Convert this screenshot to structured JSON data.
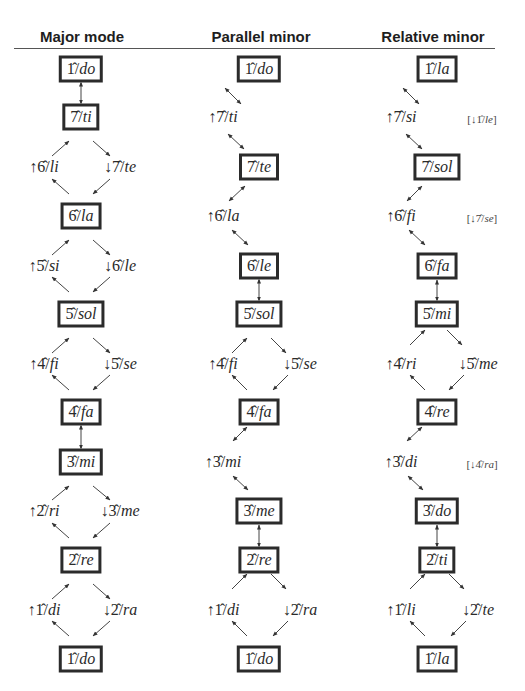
{
  "headers": {
    "major": "Major mode",
    "parallel": "Parallel minor",
    "relative": "Relative minor"
  },
  "columns": {
    "major": {
      "x": 81,
      "nodes": [
        {
          "id": "m1",
          "deg": "1̂",
          "syl": "do",
          "boxed": true,
          "x": 81,
          "y": 69
        },
        {
          "id": "m2",
          "deg": "7̂",
          "syl": "ti",
          "boxed": true,
          "x": 81,
          "y": 117
        },
        {
          "id": "m3",
          "deg": "↑6̂",
          "syl": "li",
          "boxed": false,
          "x": 44,
          "y": 167
        },
        {
          "id": "m4",
          "deg": "↓7̂",
          "syl": "te",
          "boxed": false,
          "x": 120,
          "y": 167
        },
        {
          "id": "m5",
          "deg": "6̂",
          "syl": "la",
          "boxed": true,
          "x": 81,
          "y": 216
        },
        {
          "id": "m6",
          "deg": "↑5̂",
          "syl": "si",
          "boxed": false,
          "x": 44,
          "y": 266
        },
        {
          "id": "m7",
          "deg": "↓6̂",
          "syl": "le",
          "boxed": false,
          "x": 120,
          "y": 266
        },
        {
          "id": "m8",
          "deg": "5̂",
          "syl": "sol",
          "boxed": true,
          "x": 81,
          "y": 314
        },
        {
          "id": "m9",
          "deg": "↑4̂",
          "syl": "fi",
          "boxed": false,
          "x": 44,
          "y": 364
        },
        {
          "id": "m10",
          "deg": "↓5̂",
          "syl": "se",
          "boxed": false,
          "x": 120,
          "y": 364
        },
        {
          "id": "m11",
          "deg": "4̂",
          "syl": "fa",
          "boxed": true,
          "x": 81,
          "y": 412
        },
        {
          "id": "m12",
          "deg": "3̂",
          "syl": "mi",
          "boxed": true,
          "x": 81,
          "y": 462
        },
        {
          "id": "m13",
          "deg": "↑2̂",
          "syl": "ri",
          "boxed": false,
          "x": 44,
          "y": 511
        },
        {
          "id": "m14",
          "deg": "↓3̂",
          "syl": "me",
          "boxed": false,
          "x": 120,
          "y": 511
        },
        {
          "id": "m15",
          "deg": "2̂",
          "syl": "re",
          "boxed": true,
          "x": 81,
          "y": 560
        },
        {
          "id": "m16",
          "deg": "↑1̂",
          "syl": "di",
          "boxed": false,
          "x": 44,
          "y": 610
        },
        {
          "id": "m17",
          "deg": "↓2̂",
          "syl": "ra",
          "boxed": false,
          "x": 120,
          "y": 610
        },
        {
          "id": "m18",
          "deg": "1̂",
          "syl": "do",
          "boxed": true,
          "x": 81,
          "y": 659
        }
      ]
    },
    "parallel": {
      "x": 259,
      "nodes": [
        {
          "id": "p1",
          "deg": "1̂",
          "syl": "do",
          "boxed": true,
          "x": 259,
          "y": 69
        },
        {
          "id": "p2",
          "deg": "↑7̂",
          "syl": "ti",
          "boxed": false,
          "x": 223,
          "y": 117
        },
        {
          "id": "p3",
          "deg": "7̂",
          "syl": "te",
          "boxed": true,
          "x": 259,
          "y": 167
        },
        {
          "id": "p4",
          "deg": "↑6̂",
          "syl": "la",
          "boxed": false,
          "x": 223,
          "y": 216
        },
        {
          "id": "p5",
          "deg": "6̂",
          "syl": "le",
          "boxed": true,
          "x": 259,
          "y": 266
        },
        {
          "id": "p6",
          "deg": "5̂",
          "syl": "sol",
          "boxed": true,
          "x": 259,
          "y": 314
        },
        {
          "id": "p7",
          "deg": "↑4̂",
          "syl": "fi",
          "boxed": false,
          "x": 223,
          "y": 364
        },
        {
          "id": "p8",
          "deg": "↓5̂",
          "syl": "se",
          "boxed": false,
          "x": 300,
          "y": 364
        },
        {
          "id": "p9",
          "deg": "4̂",
          "syl": "fa",
          "boxed": true,
          "x": 259,
          "y": 412
        },
        {
          "id": "p10",
          "deg": "↑3̂",
          "syl": "mi",
          "boxed": false,
          "x": 223,
          "y": 462
        },
        {
          "id": "p11",
          "deg": "3̂",
          "syl": "me",
          "boxed": true,
          "x": 259,
          "y": 511
        },
        {
          "id": "p12",
          "deg": "2̂",
          "syl": "re",
          "boxed": true,
          "x": 259,
          "y": 560
        },
        {
          "id": "p13",
          "deg": "↑1̂",
          "syl": "di",
          "boxed": false,
          "x": 223,
          "y": 610
        },
        {
          "id": "p14",
          "deg": "↓2̂",
          "syl": "ra",
          "boxed": false,
          "x": 300,
          "y": 610
        },
        {
          "id": "p15",
          "deg": "1̂",
          "syl": "do",
          "boxed": true,
          "x": 259,
          "y": 659
        }
      ]
    },
    "relative": {
      "x": 437,
      "nodes": [
        {
          "id": "r1",
          "deg": "1̂",
          "syl": "la",
          "boxed": true,
          "x": 437,
          "y": 69
        },
        {
          "id": "r2",
          "deg": "↑7̂",
          "syl": "si",
          "boxed": false,
          "x": 401,
          "y": 117
        },
        {
          "id": "r3",
          "deg": "7̂",
          "syl": "sol",
          "boxed": true,
          "x": 437,
          "y": 167
        },
        {
          "id": "r4",
          "deg": "↑6̂",
          "syl": "fi",
          "boxed": false,
          "x": 401,
          "y": 216
        },
        {
          "id": "r5",
          "deg": "6̂",
          "syl": "fa",
          "boxed": true,
          "x": 437,
          "y": 266
        },
        {
          "id": "r6",
          "deg": "5̂",
          "syl": "mi",
          "boxed": true,
          "x": 437,
          "y": 314
        },
        {
          "id": "r7",
          "deg": "↑4̂",
          "syl": "ri",
          "boxed": false,
          "x": 401,
          "y": 364
        },
        {
          "id": "r8",
          "deg": "↓5̂",
          "syl": "me",
          "boxed": false,
          "x": 478,
          "y": 364
        },
        {
          "id": "r9",
          "deg": "4̂",
          "syl": "re",
          "boxed": true,
          "x": 437,
          "y": 412
        },
        {
          "id": "r10",
          "deg": "↑3̂",
          "syl": "di",
          "boxed": false,
          "x": 401,
          "y": 462
        },
        {
          "id": "r11",
          "deg": "3̂",
          "syl": "do",
          "boxed": true,
          "x": 437,
          "y": 511
        },
        {
          "id": "r12",
          "deg": "2̂",
          "syl": "ti",
          "boxed": true,
          "x": 437,
          "y": 560
        },
        {
          "id": "r13",
          "deg": "↑1̂",
          "syl": "li",
          "boxed": false,
          "x": 401,
          "y": 610
        },
        {
          "id": "r14",
          "deg": "↓2̂",
          "syl": "te",
          "boxed": false,
          "x": 478,
          "y": 610
        },
        {
          "id": "r15",
          "deg": "1̂",
          "syl": "la",
          "boxed": true,
          "x": 437,
          "y": 659
        }
      ],
      "notes": [
        {
          "id": "n1",
          "deg": "[↓1̂/",
          "syl": "le",
          "close": "]",
          "x": 482,
          "y": 119
        },
        {
          "id": "n2",
          "deg": "[↓7̂/",
          "syl": "se",
          "close": "]",
          "x": 482,
          "y": 218
        },
        {
          "id": "n3",
          "deg": "[↓4̂/",
          "syl": "ra",
          "close": "]",
          "x": 482,
          "y": 464
        }
      ]
    }
  },
  "edges": [
    {
      "x1": 81,
      "y1": 82,
      "x2": 81,
      "y2": 104,
      "both": true
    },
    {
      "x1": 69,
      "y1": 141,
      "x2": 52,
      "y2": 156,
      "both": false,
      "head": "start"
    },
    {
      "x1": 93,
      "y1": 141,
      "x2": 110,
      "y2": 156,
      "both": false,
      "head": "end"
    },
    {
      "x1": 52,
      "y1": 179,
      "x2": 69,
      "y2": 194,
      "both": false,
      "head": "start"
    },
    {
      "x1": 110,
      "y1": 179,
      "x2": 93,
      "y2": 194,
      "both": false,
      "head": "end"
    },
    {
      "x1": 69,
      "y1": 240,
      "x2": 52,
      "y2": 255,
      "both": false,
      "head": "start"
    },
    {
      "x1": 93,
      "y1": 240,
      "x2": 110,
      "y2": 255,
      "both": false,
      "head": "end"
    },
    {
      "x1": 52,
      "y1": 277,
      "x2": 69,
      "y2": 292,
      "both": false,
      "head": "start"
    },
    {
      "x1": 110,
      "y1": 277,
      "x2": 93,
      "y2": 292,
      "both": false,
      "head": "end"
    },
    {
      "x1": 69,
      "y1": 338,
      "x2": 52,
      "y2": 353,
      "both": false,
      "head": "start"
    },
    {
      "x1": 93,
      "y1": 338,
      "x2": 110,
      "y2": 353,
      "both": false,
      "head": "end"
    },
    {
      "x1": 52,
      "y1": 375,
      "x2": 69,
      "y2": 390,
      "both": false,
      "head": "start"
    },
    {
      "x1": 110,
      "y1": 375,
      "x2": 93,
      "y2": 390,
      "both": false,
      "head": "end"
    },
    {
      "x1": 81,
      "y1": 425,
      "x2": 81,
      "y2": 449,
      "both": true
    },
    {
      "x1": 69,
      "y1": 486,
      "x2": 52,
      "y2": 500,
      "both": false,
      "head": "start"
    },
    {
      "x1": 93,
      "y1": 486,
      "x2": 110,
      "y2": 500,
      "both": false,
      "head": "end"
    },
    {
      "x1": 52,
      "y1": 523,
      "x2": 69,
      "y2": 538,
      "both": false,
      "head": "start"
    },
    {
      "x1": 110,
      "y1": 523,
      "x2": 93,
      "y2": 538,
      "both": false,
      "head": "end"
    },
    {
      "x1": 69,
      "y1": 584,
      "x2": 52,
      "y2": 599,
      "both": false,
      "head": "start"
    },
    {
      "x1": 93,
      "y1": 584,
      "x2": 110,
      "y2": 599,
      "both": false,
      "head": "end"
    },
    {
      "x1": 52,
      "y1": 621,
      "x2": 69,
      "y2": 636,
      "both": false,
      "head": "start"
    },
    {
      "x1": 110,
      "y1": 621,
      "x2": 93,
      "y2": 636,
      "both": false,
      "head": "end"
    },
    {
      "x1": 241,
      "y1": 104,
      "x2": 225,
      "y2": 88,
      "both": true,
      "swap": true
    },
    {
      "x1": 228,
      "y1": 134,
      "x2": 244,
      "y2": 149,
      "both": true
    },
    {
      "x1": 245,
      "y1": 186,
      "x2": 229,
      "y2": 201,
      "both": true
    },
    {
      "x1": 232,
      "y1": 230,
      "x2": 248,
      "y2": 245,
      "both": true
    },
    {
      "x1": 259,
      "y1": 279,
      "x2": 259,
      "y2": 301,
      "both": true
    },
    {
      "x1": 247,
      "y1": 338,
      "x2": 232,
      "y2": 353,
      "both": false,
      "head": "start"
    },
    {
      "x1": 271,
      "y1": 338,
      "x2": 286,
      "y2": 353,
      "both": false,
      "head": "end"
    },
    {
      "x1": 232,
      "y1": 375,
      "x2": 247,
      "y2": 390,
      "both": false,
      "head": "start"
    },
    {
      "x1": 288,
      "y1": 375,
      "x2": 273,
      "y2": 390,
      "both": false,
      "head": "end"
    },
    {
      "x1": 247,
      "y1": 427,
      "x2": 233,
      "y2": 441,
      "both": true
    },
    {
      "x1": 233,
      "y1": 476,
      "x2": 248,
      "y2": 490,
      "both": true
    },
    {
      "x1": 259,
      "y1": 525,
      "x2": 259,
      "y2": 547,
      "both": true
    },
    {
      "x1": 247,
      "y1": 574,
      "x2": 232,
      "y2": 589,
      "both": false,
      "head": "start"
    },
    {
      "x1": 271,
      "y1": 574,
      "x2": 286,
      "y2": 589,
      "both": false,
      "head": "end"
    },
    {
      "x1": 232,
      "y1": 621,
      "x2": 247,
      "y2": 636,
      "both": false,
      "head": "start"
    },
    {
      "x1": 288,
      "y1": 621,
      "x2": 273,
      "y2": 636,
      "both": false,
      "head": "end"
    },
    {
      "x1": 419,
      "y1": 104,
      "x2": 403,
      "y2": 88,
      "both": true,
      "swap": true
    },
    {
      "x1": 406,
      "y1": 134,
      "x2": 422,
      "y2": 149,
      "both": true
    },
    {
      "x1": 422,
      "y1": 186,
      "x2": 407,
      "y2": 201,
      "both": true
    },
    {
      "x1": 409,
      "y1": 230,
      "x2": 425,
      "y2": 245,
      "both": true
    },
    {
      "x1": 437,
      "y1": 280,
      "x2": 437,
      "y2": 301,
      "both": true
    },
    {
      "x1": 425,
      "y1": 330,
      "x2": 410,
      "y2": 345,
      "both": false,
      "head": "start"
    },
    {
      "x1": 447,
      "y1": 330,
      "x2": 462,
      "y2": 345,
      "both": false,
      "head": "end"
    },
    {
      "x1": 410,
      "y1": 375,
      "x2": 425,
      "y2": 390,
      "both": false,
      "head": "start"
    },
    {
      "x1": 464,
      "y1": 375,
      "x2": 449,
      "y2": 390,
      "both": false,
      "head": "end"
    },
    {
      "x1": 422,
      "y1": 427,
      "x2": 407,
      "y2": 441,
      "both": true
    },
    {
      "x1": 408,
      "y1": 476,
      "x2": 423,
      "y2": 490,
      "both": true
    },
    {
      "x1": 437,
      "y1": 525,
      "x2": 437,
      "y2": 547,
      "both": true
    },
    {
      "x1": 425,
      "y1": 574,
      "x2": 410,
      "y2": 589,
      "both": false,
      "head": "start"
    },
    {
      "x1": 449,
      "y1": 574,
      "x2": 464,
      "y2": 589,
      "both": false,
      "head": "end"
    },
    {
      "x1": 410,
      "y1": 621,
      "x2": 425,
      "y2": 636,
      "both": false,
      "head": "start"
    },
    {
      "x1": 466,
      "y1": 621,
      "x2": 451,
      "y2": 636,
      "both": false,
      "head": "end"
    }
  ]
}
